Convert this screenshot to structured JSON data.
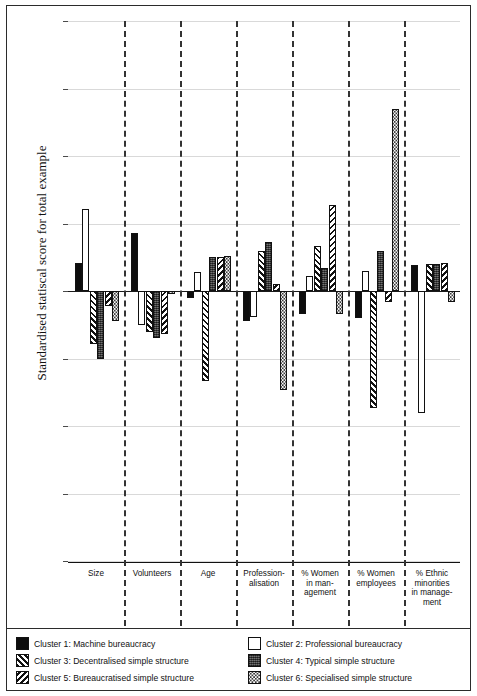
{
  "chart_data": {
    "type": "bar",
    "title": "",
    "xlabel": "",
    "ylabel": "Standardised statiscal score for total example",
    "ylim": [
      -2,
      2
    ],
    "ytick_labels": [
      "2",
      "1.5",
      "1",
      "0.5",
      "0",
      "-0.5",
      "-1",
      "-1.5",
      "-2"
    ],
    "ytick_values": [
      2,
      1.5,
      1,
      0.5,
      0,
      -0.5,
      -1,
      -1.5,
      -2
    ],
    "grid": true,
    "legend_position": "below-axes",
    "categories": [
      "Size",
      "Volunteers",
      "Age",
      "Profession-\nalisation",
      "% Women\nin man-\nagement",
      "% Women\nemployees",
      "% Ethnic\nminorities\nin manage-\nment"
    ],
    "category_lines": [
      [
        "Size"
      ],
      [
        "Volunteers"
      ],
      [
        "Age"
      ],
      [
        "Profession-",
        "alisation"
      ],
      [
        "% Women",
        "in man-",
        "agement"
      ],
      [
        "% Women",
        "employees"
      ],
      [
        "% Ethnic",
        "minorities",
        "in manage-",
        "ment"
      ]
    ],
    "series": [
      {
        "name": "Cluster 1: Machine bureaucracy",
        "key": "c1",
        "values": [
          0.21,
          0.43,
          -0.05,
          -0.22,
          -0.17,
          -0.2,
          0.19
        ]
      },
      {
        "name": "Cluster 2: Professional bureaucracy",
        "key": "c2",
        "values": [
          0.61,
          -0.25,
          0.14,
          -0.19,
          0.11,
          0.15,
          -0.9
        ]
      },
      {
        "name": "Cluster 3: Decentralised simple structure",
        "key": "c3",
        "values": [
          -0.39,
          -0.3,
          -0.67,
          0.3,
          0.33,
          -0.87,
          0.2
        ]
      },
      {
        "name": "Cluster 4: Typical simple structure",
        "key": "c4",
        "values": [
          -0.5,
          -0.35,
          0.25,
          0.36,
          0.17,
          0.3,
          0.2
        ]
      },
      {
        "name": "Cluster 5: Bureaucratised simple structure",
        "key": "c5",
        "values": [
          -0.11,
          -0.32,
          0.25,
          0.05,
          0.64,
          -0.08,
          0.21
        ]
      },
      {
        "name": "Cluster 6: Specialised simple structure",
        "key": "c6",
        "values": [
          -0.22,
          -0.02,
          0.26,
          -0.73,
          -0.17,
          1.35,
          -0.08
        ]
      }
    ]
  },
  "legend": {
    "items": [
      {
        "label": "Cluster 1: Machine bureaucracy",
        "key": "c1"
      },
      {
        "label": "Cluster 2: Professional bureaucracy",
        "key": "c2"
      },
      {
        "label": "Cluster 3: Decentralised simple structure",
        "key": "c3"
      },
      {
        "label": "Cluster 4: Typical simple structure",
        "key": "c4"
      },
      {
        "label": "Cluster 5: Bureaucratised simple structure",
        "key": "c5"
      },
      {
        "label": "Cluster 6: Specialised simple structure",
        "key": "c6"
      }
    ]
  }
}
